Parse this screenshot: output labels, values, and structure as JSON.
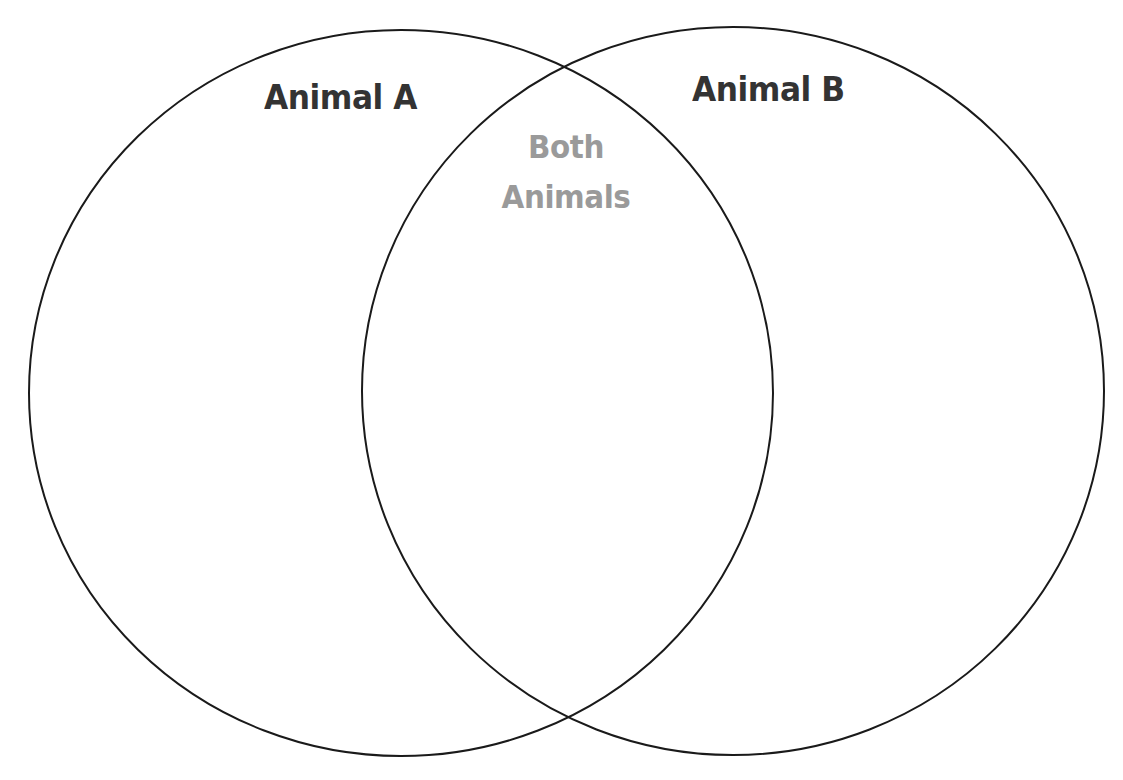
{
  "diagram": {
    "type": "venn",
    "sets": [
      {
        "id": "A",
        "label": "Animal A",
        "label_color": "#333333",
        "circle": {
          "cx": 401,
          "cy": 393,
          "rx": 372,
          "ry": 363
        }
      },
      {
        "id": "B",
        "label": "Animal B",
        "label_color": "#333333",
        "circle": {
          "cx": 733,
          "cy": 391,
          "rx": 371,
          "ry": 364
        }
      }
    ],
    "intersection": {
      "label_line1": "Both",
      "label_line2": "Animals",
      "label_color": "#9a9a9a"
    },
    "stroke_color": "#1a1a1a",
    "background": "#ffffff"
  }
}
